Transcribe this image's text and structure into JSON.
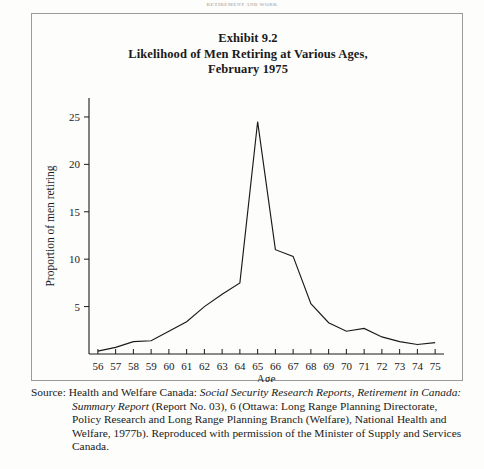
{
  "running_head": "RETIREMENT AND WORK",
  "figure": {
    "title_lines": [
      "Exhibit 9.2",
      "Likelihood of Men Retiring at Various Ages,",
      "February 1975"
    ]
  },
  "source": {
    "label": "Source:",
    "segments": [
      {
        "text": "Health and Welfare Canada: ",
        "italic": false
      },
      {
        "text": "Social Security Research Reports, Retirement in Canada: Summary Report",
        "italic": true
      },
      {
        "text": " (Report No. 03), 6 (Ottawa: Long Range Planning Directorate, Policy Research and Long Range Planning Branch (Welfare), National Health and Welfare, 1977b). Reproduced with permission of the Minister of Supply and Services Canada.",
        "italic": false
      }
    ]
  },
  "chart_data": {
    "type": "line",
    "xlabel": "Age",
    "ylabel": "Proportion of men retiring",
    "x": [
      56,
      57,
      58,
      59,
      60,
      61,
      62,
      63,
      64,
      65,
      66,
      67,
      68,
      69,
      70,
      71,
      72,
      73,
      74,
      75
    ],
    "values": [
      0.3,
      0.7,
      1.3,
      1.4,
      2.4,
      3.4,
      5.0,
      6.3,
      7.5,
      24.5,
      11.0,
      10.3,
      5.3,
      3.3,
      2.4,
      2.7,
      1.8,
      1.3,
      1.0,
      1.2
    ],
    "xtick_labels": [
      "56",
      "57",
      "58",
      "59",
      "60",
      "61",
      "62",
      "63",
      "64",
      "65",
      "66",
      "67",
      "68",
      "69",
      "70",
      "71",
      "72",
      "73",
      "74",
      "75"
    ],
    "ytick_labels": [
      "5",
      "10",
      "15",
      "20",
      "25"
    ],
    "yticks": [
      5,
      10,
      15,
      20,
      25
    ],
    "xlim": [
      55.5,
      75.5
    ],
    "ylim": [
      0,
      27
    ],
    "grid": false,
    "legend": null,
    "line_color": "#1a1a1a"
  }
}
